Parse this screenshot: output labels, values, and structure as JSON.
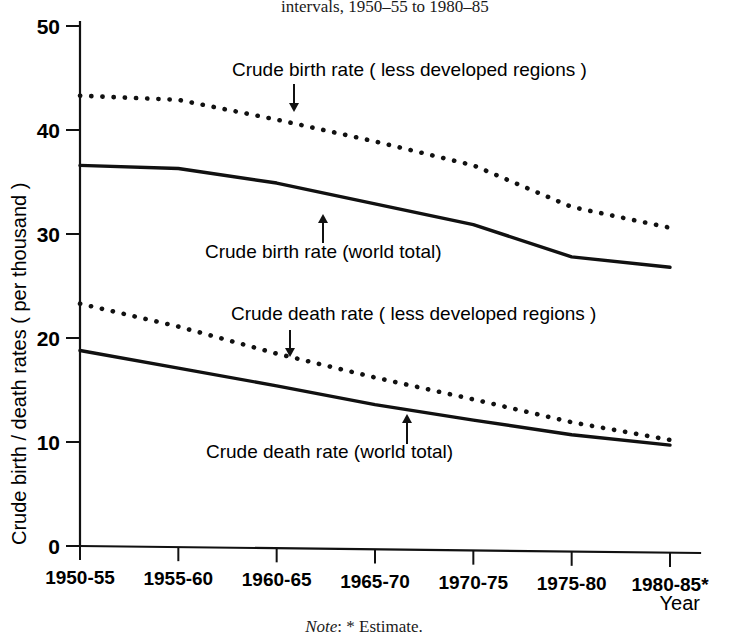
{
  "figure": {
    "title": "intervals, 1950–55 to 1980–85",
    "note_label": "Note",
    "note_text": ": * Estimate.",
    "x_axis_title": "Year",
    "y_axis_title": "Crude birth / death rates ( per thousand )"
  },
  "chart_data": {
    "type": "line",
    "title": "intervals, 1950–55 to 1980–85",
    "xlabel": "Year",
    "ylabel": "Crude birth / death rates ( per thousand )",
    "categories": [
      "1950-55",
      "1955-60",
      "1960-65",
      "1965-70",
      "1970-75",
      "1975-80",
      "1980-85*"
    ],
    "xtick_labels": [
      "1950-55",
      "1955-60",
      "1960-65",
      "1965-70",
      "1970-75",
      "1975-80",
      "1980-85*"
    ],
    "ytick_labels": [
      "0",
      "10",
      "20",
      "30",
      "40",
      "50"
    ],
    "yticks": [
      0,
      10,
      20,
      30,
      40,
      50
    ],
    "ylim": [
      0,
      50
    ],
    "grid": false,
    "legend": "inline-annotations",
    "series": [
      {
        "name": "Crude birth rate ( less developed regions )",
        "style": "dotted",
        "values": [
          43.3,
          42.9,
          41.0,
          38.9,
          36.6,
          32.6,
          30.6
        ]
      },
      {
        "name": "Crude birth rate (world total)",
        "style": "solid",
        "values": [
          36.6,
          36.3,
          34.9,
          32.9,
          30.9,
          27.8,
          26.8
        ]
      },
      {
        "name": "Crude death rate ( less developed regions )",
        "style": "dotted",
        "values": [
          23.3,
          21.1,
          18.5,
          16.2,
          14.1,
          11.9,
          10.2
        ]
      },
      {
        "name": "Crude death rate (world total)",
        "style": "solid",
        "values": [
          18.8,
          17.1,
          15.4,
          13.6,
          12.1,
          10.7,
          9.7
        ]
      }
    ],
    "annotations": [
      {
        "text": "Crude birth rate ( less developed regions )",
        "label_x": 232,
        "label_y": 76,
        "arrow_x": 294,
        "arrow_from_y": 84,
        "arrow_to_y": 112,
        "direction": "down"
      },
      {
        "text": "Crude birth rate (world total)",
        "label_x": 205,
        "label_y": 258,
        "arrow_x": 323,
        "arrow_from_y": 243,
        "arrow_to_y": 214,
        "direction": "up"
      },
      {
        "text": "Crude death rate ( less developed regions )",
        "label_x": 231,
        "label_y": 320,
        "arrow_x": 290,
        "arrow_from_y": 330,
        "arrow_to_y": 357,
        "direction": "down"
      },
      {
        "text": "Crude death rate (world total)",
        "label_x": 206,
        "label_y": 458,
        "arrow_x": 407,
        "arrow_from_y": 444,
        "arrow_to_y": 414,
        "direction": "up"
      }
    ]
  }
}
